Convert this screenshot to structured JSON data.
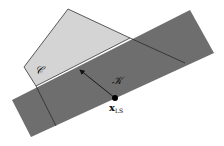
{
  "diagram": {
    "colors": {
      "background": "#ffffff",
      "set_c_fill": "#d4d4d4",
      "set_k_fill": "#6e6e6e",
      "edge": "#333333",
      "point": "#000000"
    },
    "labels": {
      "set_c": "𝒞",
      "set_k": "𝒦",
      "point_main": "x",
      "point_sub": "LS"
    },
    "shapes": {
      "set_c_polygon": "68,9 130,38 185,63 56,126 24,67",
      "set_k_band": "12,100 190,10 214,53 31,137",
      "hidden_edge_1": "M36,86 L56,126",
      "hidden_edge_2": "M130,38 L185,63"
    },
    "arrow": {
      "from": [
        115,
        98
      ],
      "to": [
        79,
        69
      ]
    },
    "point": {
      "x": 115,
      "y": 98,
      "r": 3
    }
  }
}
